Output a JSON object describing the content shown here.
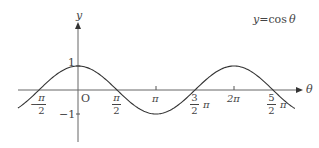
{
  "chart_data": {
    "type": "line",
    "xlabel": "θ",
    "ylabel": "y",
    "function": "cos",
    "x_range": [
      -0.77,
      2.78
    ],
    "x_unit": "π",
    "ylim": [
      -1,
      1
    ],
    "grid": false,
    "origin_label": "O",
    "x_ticks": [
      {
        "value": -0.5,
        "label_num": "π",
        "label_den": "2",
        "sign": "−"
      },
      {
        "value": 0.5,
        "label_num": "π",
        "label_den": "2",
        "sign": ""
      },
      {
        "value": 1,
        "label": "π"
      },
      {
        "value": 1.5,
        "label_num": "3",
        "label_den": "2",
        "suffix": "π"
      },
      {
        "value": 2,
        "label": "2π"
      },
      {
        "value": 2.5,
        "label_num": "5",
        "label_den": "2",
        "suffix": "π"
      }
    ],
    "y_ticks": [
      {
        "value": 1,
        "label": "1"
      },
      {
        "value": -1,
        "label": "−1"
      }
    ],
    "series": [
      {
        "name": "y = cos θ",
        "x": [
          -0.75,
          -0.5,
          0,
          0.5,
          1,
          1.5,
          2,
          2.5,
          2.75
        ],
        "values": [
          -0.707,
          0,
          1,
          0,
          -1,
          0,
          1,
          0,
          -0.707
        ]
      }
    ]
  },
  "labels": {
    "title_y": "y",
    "title_eq": "=",
    "title_cos": "cos",
    "title_theta": "θ",
    "axis_y": "y",
    "axis_x": "θ",
    "origin": "O",
    "y_one": "1",
    "y_minus_one": "−1",
    "neg_half_sign": "−",
    "neg_half_num": "π",
    "neg_half_den": "2",
    "half_num": "π",
    "half_den": "2",
    "pi": "π",
    "three_half_num": "3",
    "three_half_den": "2",
    "three_half_suffix": "π",
    "two_pi": "2π",
    "five_half_num": "5",
    "five_half_den": "2",
    "five_half_suffix": "π"
  },
  "colors": {
    "axis": "#555555",
    "curve": "#333333",
    "text": "#444444"
  }
}
